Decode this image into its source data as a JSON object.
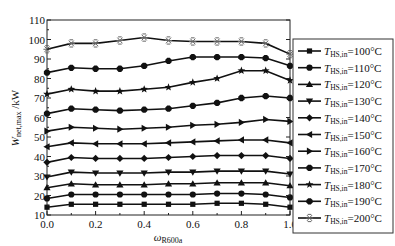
{
  "chart_data": {
    "type": "line",
    "title": "",
    "xlabel": "ω_R600a",
    "xlabel_main": "ω",
    "xlabel_sub": "R600a",
    "ylabel": "W_net,max /kW",
    "ylabel_main": "W",
    "ylabel_sub": "net,max",
    "ylabel_unit": " /kW",
    "xlim": [
      0.0,
      1.0
    ],
    "ylim": [
      10,
      110
    ],
    "xticks": [
      0.0,
      0.2,
      0.4,
      0.6,
      0.8,
      1.0
    ],
    "xtick_labels": [
      "0.0",
      "0.2",
      "0.4",
      "0.6",
      "0.8",
      "1.0"
    ],
    "yticks": [
      10,
      20,
      30,
      40,
      50,
      60,
      70,
      80,
      90,
      100,
      110
    ],
    "ytick_labels": [
      "10",
      "20",
      "30",
      "40",
      "50",
      "60",
      "70",
      "80",
      "90",
      "100",
      "110"
    ],
    "grid": false,
    "legend_position": "right-outside",
    "x": [
      0.0,
      0.1,
      0.2,
      0.3,
      0.4,
      0.5,
      0.6,
      0.7,
      0.8,
      0.9,
      1.0
    ],
    "series": [
      {
        "name": "T_HS,in=100°C",
        "label_main": "T",
        "label_sub": "HS,in",
        "label_rest": "=100°C",
        "marker": "square",
        "values": [
          14,
          15.5,
          15.5,
          15.5,
          15.5,
          15.5,
          15.5,
          16,
          16,
          15.5,
          14
        ]
      },
      {
        "name": "T_HS,in=110°C",
        "label_main": "T",
        "label_sub": "HS,in",
        "label_rest": "=110°C",
        "marker": "circle",
        "values": [
          18.5,
          20.5,
          20.5,
          20.5,
          20.5,
          20.5,
          20.5,
          21,
          21,
          20.5,
          19
        ]
      },
      {
        "name": "T_HS,in=120°C",
        "label_main": "T",
        "label_sub": "HS,in",
        "label_rest": "=120°C",
        "marker": "triangle-up",
        "values": [
          24,
          26,
          25.5,
          25.5,
          25.5,
          26,
          26,
          26.5,
          26.5,
          26.5,
          25
        ]
      },
      {
        "name": "T_HS,in=130°C",
        "label_main": "T",
        "label_sub": "HS,in",
        "label_rest": "=130°C",
        "marker": "triangle-down",
        "values": [
          29.5,
          32,
          31.5,
          31.5,
          31.5,
          32,
          32,
          32.5,
          32.5,
          32.5,
          31
        ]
      },
      {
        "name": "T_HS,in=140°C",
        "label_main": "T",
        "label_sub": "HS,in",
        "label_rest": "=140°C",
        "marker": "diamond",
        "values": [
          37,
          39.5,
          39,
          39,
          39,
          39.5,
          40,
          40.5,
          40.5,
          40.5,
          39
        ]
      },
      {
        "name": "T_HS,in=150°C",
        "label_main": "T",
        "label_sub": "HS,in",
        "label_rest": "=150°C",
        "marker": "triangle-left",
        "values": [
          45,
          47,
          46.5,
          46.5,
          46.5,
          47,
          47.5,
          48,
          48.5,
          48.5,
          47
        ]
      },
      {
        "name": "T_HS,in=160°C",
        "label_main": "T",
        "label_sub": "HS,in",
        "label_rest": "=160°C",
        "marker": "triangle-right",
        "values": [
          53,
          55,
          54.5,
          54,
          54.5,
          55,
          56,
          56.5,
          57.5,
          59,
          58
        ]
      },
      {
        "name": "T_HS,in=170°C",
        "label_main": "T",
        "label_sub": "HS,in",
        "label_rest": "=170°C",
        "marker": "hexagon",
        "values": [
          62,
          64.5,
          64,
          63.5,
          64,
          64.5,
          66,
          67.5,
          70,
          71,
          70
        ]
      },
      {
        "name": "T_HS,in=180°C",
        "label_main": "T",
        "label_sub": "HS,in",
        "label_rest": "=180°C",
        "marker": "star",
        "values": [
          72,
          74.5,
          73.5,
          73.5,
          74.5,
          75.5,
          78,
          80,
          84,
          84,
          79
        ]
      },
      {
        "name": "T_HS,in=190°C",
        "label_main": "T",
        "label_sub": "HS,in",
        "label_rest": "=190°C",
        "marker": "hexagon",
        "values": [
          83,
          85.5,
          85,
          85,
          86.5,
          89,
          91,
          91,
          91,
          90.5,
          86.5
        ]
      },
      {
        "name": "T_HS,in=200°C",
        "label_main": "T",
        "label_sub": "HS,in",
        "label_rest": "=200°C",
        "marker": "asterisk",
        "values": [
          95,
          98,
          98,
          99.5,
          101,
          99.5,
          99,
          99,
          99,
          98,
          92.5
        ]
      }
    ]
  },
  "colors": {
    "line": "#111111",
    "marker": "#111111",
    "asterisk_marker": "#666666",
    "axis": "#222222",
    "legend_border": "#333333",
    "background": "#ffffff"
  }
}
